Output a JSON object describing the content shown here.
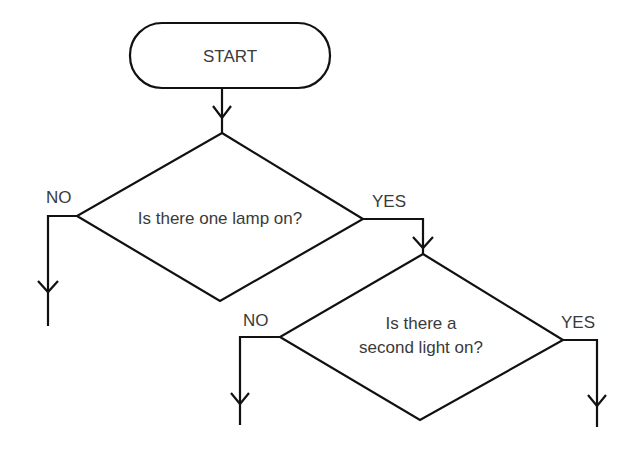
{
  "diagram": {
    "type": "flowchart",
    "colors": {
      "stroke": "#111111",
      "text": "#3a3a3a",
      "background": "#ffffff"
    },
    "nodes": [
      {
        "id": "start",
        "shape": "terminator",
        "label": "START"
      },
      {
        "id": "q1",
        "shape": "decision",
        "label": "Is there one lamp on?"
      },
      {
        "id": "q2",
        "shape": "decision",
        "label_lines": [
          "Is there a",
          "second light on?"
        ]
      }
    ],
    "edges": [
      {
        "from": "start",
        "to": "q1",
        "label": ""
      },
      {
        "from": "q1",
        "to": "exit-left",
        "label": "NO"
      },
      {
        "from": "q1",
        "to": "q2",
        "label": "YES"
      },
      {
        "from": "q2",
        "to": "exit-left",
        "label": "NO"
      },
      {
        "from": "q2",
        "to": "exit-right",
        "label": "YES"
      }
    ]
  }
}
